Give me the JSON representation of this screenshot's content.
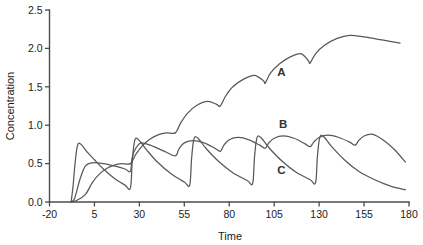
{
  "chart_data": {
    "type": "line",
    "title": "",
    "xlabel": "Time",
    "ylabel": "Concentration",
    "xlim": [
      -20,
      180
    ],
    "ylim": [
      0.0,
      2.5
    ],
    "xticks": [
      "-20",
      "5",
      "30",
      "55",
      "80",
      "105",
      "130",
      "155",
      "180"
    ],
    "xtick_values": [
      -20,
      5,
      30,
      55,
      80,
      105,
      130,
      155,
      180
    ],
    "yticks": [
      "0.0",
      "0.5",
      "1.0",
      "1.5",
      "2.0",
      "2.5"
    ],
    "ytick_values": [
      0.0,
      0.5,
      1.0,
      1.5,
      2.0,
      2.5
    ],
    "grid": false,
    "legend_position": "inline-annotations",
    "dose_times": [
      0,
      25,
      50,
      75,
      100,
      125,
      150
    ],
    "annotations": [
      {
        "text": "A",
        "x": 109,
        "y": 1.64
      },
      {
        "text": "B",
        "x": 110,
        "y": 0.97
      },
      {
        "text": "C",
        "x": 109,
        "y": 0.37
      }
    ],
    "series": [
      {
        "name": "A",
        "color": "#585858",
        "description": "Slow elimination, strong accumulation; staircase rise toward steady state",
        "points": [
          [
            -8,
            0.0
          ],
          [
            -5,
            0.02
          ],
          [
            0,
            0.1
          ],
          [
            4,
            0.26
          ],
          [
            8,
            0.37
          ],
          [
            12,
            0.44
          ],
          [
            16,
            0.48
          ],
          [
            20,
            0.5
          ],
          [
            25,
            0.5
          ],
          [
            28,
            0.62
          ],
          [
            32,
            0.74
          ],
          [
            36,
            0.82
          ],
          [
            40,
            0.87
          ],
          [
            45,
            0.9
          ],
          [
            50,
            0.9
          ],
          [
            53,
            1.03
          ],
          [
            57,
            1.16
          ],
          [
            62,
            1.26
          ],
          [
            68,
            1.31
          ],
          [
            73,
            1.27
          ],
          [
            75,
            1.25
          ],
          [
            78,
            1.38
          ],
          [
            82,
            1.5
          ],
          [
            88,
            1.6
          ],
          [
            94,
            1.65
          ],
          [
            99,
            1.58
          ],
          [
            100,
            1.55
          ],
          [
            103,
            1.68
          ],
          [
            108,
            1.8
          ],
          [
            114,
            1.89
          ],
          [
            120,
            1.93
          ],
          [
            124,
            1.84
          ],
          [
            125,
            1.81
          ],
          [
            128,
            1.93
          ],
          [
            133,
            2.04
          ],
          [
            140,
            2.13
          ],
          [
            147,
            2.17
          ],
          [
            155,
            2.15
          ],
          [
            165,
            2.11
          ],
          [
            175,
            2.07
          ]
        ]
      },
      {
        "name": "B",
        "color": "#585858",
        "description": "Intermediate half-life; sawtooth with rising troughs, peaks near 0.85",
        "points": [
          [
            -8,
            0.0
          ],
          [
            -6,
            0.05
          ],
          [
            -3,
            0.3
          ],
          [
            0,
            0.47
          ],
          [
            4,
            0.51
          ],
          [
            10,
            0.5
          ],
          [
            16,
            0.47
          ],
          [
            22,
            0.43
          ],
          [
            25,
            0.4
          ],
          [
            26,
            0.58
          ],
          [
            28,
            0.7
          ],
          [
            31,
            0.77
          ],
          [
            36,
            0.74
          ],
          [
            44,
            0.66
          ],
          [
            50,
            0.6
          ],
          [
            52,
            0.69
          ],
          [
            55,
            0.77
          ],
          [
            60,
            0.8
          ],
          [
            66,
            0.77
          ],
          [
            72,
            0.7
          ],
          [
            75,
            0.66
          ],
          [
            77,
            0.74
          ],
          [
            80,
            0.81
          ],
          [
            85,
            0.84
          ],
          [
            91,
            0.81
          ],
          [
            97,
            0.74
          ],
          [
            100,
            0.7
          ],
          [
            102,
            0.77
          ],
          [
            105,
            0.83
          ],
          [
            110,
            0.86
          ],
          [
            116,
            0.83
          ],
          [
            122,
            0.76
          ],
          [
            125,
            0.72
          ],
          [
            127,
            0.78
          ],
          [
            130,
            0.84
          ],
          [
            135,
            0.87
          ],
          [
            141,
            0.84
          ],
          [
            147,
            0.78
          ],
          [
            150,
            0.74
          ],
          [
            152,
            0.8
          ],
          [
            155,
            0.86
          ],
          [
            160,
            0.88
          ],
          [
            166,
            0.8
          ],
          [
            172,
            0.68
          ],
          [
            178,
            0.52
          ]
        ]
      },
      {
        "name": "C",
        "color": "#585858",
        "description": "Fast absorption and elimination; tall narrow spikes decaying to low troughs each interval",
        "points": [
          [
            -8,
            0.0
          ],
          [
            -7,
            0.18
          ],
          [
            -6,
            0.45
          ],
          [
            -5,
            0.66
          ],
          [
            -4,
            0.76
          ],
          [
            -2,
            0.74
          ],
          [
            1,
            0.65
          ],
          [
            5,
            0.55
          ],
          [
            10,
            0.43
          ],
          [
            16,
            0.31
          ],
          [
            22,
            0.22
          ],
          [
            25,
            0.18
          ],
          [
            26,
            0.52
          ],
          [
            27,
            0.75
          ],
          [
            28,
            0.83
          ],
          [
            30,
            0.8
          ],
          [
            34,
            0.68
          ],
          [
            40,
            0.52
          ],
          [
            48,
            0.36
          ],
          [
            55,
            0.26
          ],
          [
            58,
            0.22
          ],
          [
            59,
            0.55
          ],
          [
            60,
            0.78
          ],
          [
            61,
            0.85
          ],
          [
            63,
            0.82
          ],
          [
            67,
            0.7
          ],
          [
            74,
            0.53
          ],
          [
            82,
            0.38
          ],
          [
            90,
            0.28
          ],
          [
            93,
            0.24
          ],
          [
            94,
            0.57
          ],
          [
            95,
            0.79
          ],
          [
            96,
            0.86
          ],
          [
            98,
            0.83
          ],
          [
            102,
            0.71
          ],
          [
            109,
            0.54
          ],
          [
            117,
            0.39
          ],
          [
            125,
            0.29
          ],
          [
            128,
            0.25
          ],
          [
            129,
            0.58
          ],
          [
            130,
            0.8
          ],
          [
            131,
            0.87
          ],
          [
            133,
            0.84
          ],
          [
            137,
            0.72
          ],
          [
            144,
            0.55
          ],
          [
            152,
            0.4
          ],
          [
            160,
            0.3
          ],
          [
            166,
            0.24
          ],
          [
            172,
            0.19
          ],
          [
            178,
            0.16
          ]
        ]
      }
    ]
  },
  "axes": {
    "x_title": "Time",
    "y_title": "Concentration"
  }
}
